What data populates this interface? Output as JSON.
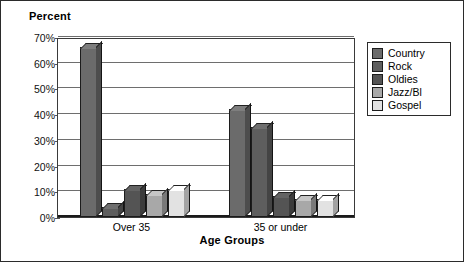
{
  "chart_data": {
    "type": "bar",
    "title": "",
    "xlabel": "Age Groups",
    "ylabel": "Percent",
    "categories": [
      "Over 35",
      "35 or under"
    ],
    "series": [
      {
        "name": "Country",
        "values": [
          66,
          42
        ],
        "color": "#6b6b6b"
      },
      {
        "name": "Rock",
        "values": [
          4,
          35
        ],
        "color": "#5e5e5e"
      },
      {
        "name": "Oldies",
        "values": [
          11,
          8
        ],
        "color": "#545454"
      },
      {
        "name": "Jazz/Bl",
        "values": [
          9,
          7
        ],
        "color": "#a8a8a8"
      },
      {
        "name": "Gospel",
        "values": [
          11,
          7
        ],
        "color": "#e2e2e2"
      }
    ],
    "ylim": [
      0,
      70
    ],
    "yticks": [
      "0%",
      "10%",
      "20%",
      "30%",
      "40%",
      "50%",
      "60%",
      "70%"
    ],
    "ytick_values": [
      0,
      10,
      20,
      30,
      40,
      50,
      60,
      70
    ],
    "minor_tick_values": [
      5,
      15,
      25,
      35,
      45,
      55,
      65
    ],
    "grid": true,
    "legend_position": "right",
    "value_suffix": "%"
  },
  "legend": {
    "items": [
      {
        "label": "Country",
        "color": "#6b6b6b"
      },
      {
        "label": "Rock",
        "color": "#5e5e5e"
      },
      {
        "label": "Oldies",
        "color": "#545454"
      },
      {
        "label": "Jazz/Bl",
        "color": "#a8a8a8"
      },
      {
        "label": "Gospel",
        "color": "#e2e2e2"
      }
    ]
  }
}
